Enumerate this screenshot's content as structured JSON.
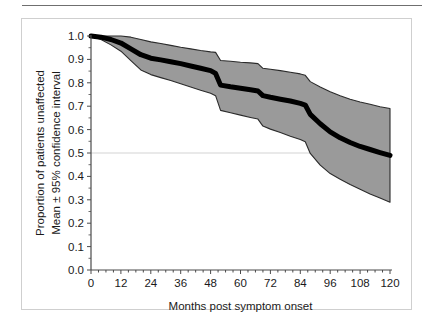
{
  "figure": {
    "background_color": "#ffffff",
    "panel_border_color": "#cfcfcf",
    "top_rule_color": "#6f6f6f"
  },
  "chart_data": {
    "type": "line",
    "title": "",
    "subtitle": "",
    "xlabel": "Months post symptom onset",
    "ylabel": "Proportion of patients unaffected\nMean ± 95% confidence interval",
    "ylabel_line1": "Proportion of patients unaffected",
    "ylabel_line2": "Mean ± 95% confidence interval",
    "xlim": [
      0,
      120
    ],
    "ylim": [
      0.0,
      1.0
    ],
    "xticks": [
      0,
      12,
      24,
      36,
      48,
      60,
      72,
      84,
      96,
      108,
      120
    ],
    "xtick_labels": [
      "0",
      "12",
      "24",
      "36",
      "48",
      "60",
      "72",
      "84",
      "96",
      "108",
      "120"
    ],
    "yticks": [
      0.0,
      0.1,
      0.2,
      0.3,
      0.4,
      0.5,
      0.6,
      0.7,
      0.8,
      0.9,
      1.0
    ],
    "ytick_labels": [
      "0.0",
      "0.1",
      "0.2",
      "0.3",
      "0.4",
      "0.5",
      "0.6",
      "0.7",
      "0.8",
      "0.9",
      "1.0"
    ],
    "x_minor_tick_step": 3,
    "grid": true,
    "gridlines_y": [
      0.5
    ],
    "grid_color": "#c8c8c8",
    "legend": null,
    "legend_position": "none",
    "annotations": [],
    "line_color": "#000000",
    "line_width_px": 5,
    "band_color": "#9a9a9a",
    "band_edge_color": "#2b2b2b",
    "axis_color": "#4a4a4a",
    "series": [
      {
        "name": "Mean",
        "x": [
          0,
          4,
          8,
          12,
          16,
          20,
          24,
          28,
          32,
          36,
          40,
          44,
          48,
          50,
          52,
          56,
          60,
          64,
          67,
          69,
          72,
          76,
          80,
          84,
          86,
          88,
          92,
          96,
          100,
          104,
          108,
          112,
          116,
          120
        ],
        "values": [
          1.0,
          0.995,
          0.985,
          0.97,
          0.945,
          0.92,
          0.905,
          0.898,
          0.89,
          0.882,
          0.872,
          0.862,
          0.852,
          0.84,
          0.79,
          0.783,
          0.777,
          0.77,
          0.765,
          0.745,
          0.738,
          0.73,
          0.722,
          0.712,
          0.705,
          0.665,
          0.625,
          0.59,
          0.565,
          0.545,
          0.528,
          0.515,
          0.502,
          0.49
        ]
      },
      {
        "name": "Upper 95% CI",
        "x": [
          0,
          4,
          8,
          12,
          16,
          20,
          24,
          28,
          32,
          36,
          40,
          44,
          48,
          50,
          52,
          56,
          60,
          64,
          67,
          69,
          72,
          76,
          80,
          84,
          86,
          88,
          92,
          96,
          100,
          104,
          108,
          112,
          116,
          120
        ],
        "values": [
          1.0,
          1.0,
          1.0,
          1.0,
          0.995,
          0.985,
          0.975,
          0.968,
          0.96,
          0.952,
          0.945,
          0.938,
          0.932,
          0.93,
          0.895,
          0.892,
          0.888,
          0.885,
          0.882,
          0.862,
          0.858,
          0.852,
          0.845,
          0.838,
          0.832,
          0.805,
          0.782,
          0.762,
          0.745,
          0.73,
          0.718,
          0.708,
          0.698,
          0.69
        ]
      },
      {
        "name": "Lower 95% CI",
        "x": [
          0,
          4,
          8,
          12,
          16,
          20,
          24,
          28,
          32,
          36,
          40,
          44,
          48,
          50,
          52,
          56,
          60,
          64,
          67,
          69,
          72,
          76,
          80,
          84,
          86,
          88,
          92,
          96,
          100,
          104,
          108,
          112,
          116,
          120
        ],
        "values": [
          1.0,
          0.985,
          0.962,
          0.935,
          0.895,
          0.855,
          0.835,
          0.822,
          0.81,
          0.796,
          0.782,
          0.768,
          0.755,
          0.745,
          0.682,
          0.672,
          0.662,
          0.652,
          0.645,
          0.615,
          0.602,
          0.588,
          0.572,
          0.558,
          0.548,
          0.498,
          0.448,
          0.412,
          0.388,
          0.365,
          0.345,
          0.325,
          0.308,
          0.29
        ]
      }
    ]
  }
}
